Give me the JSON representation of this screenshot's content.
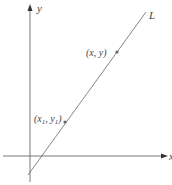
{
  "diagram": {
    "axes": {
      "x_label": "x",
      "y_label": "y",
      "origin_px": [
        30,
        156
      ]
    },
    "line": {
      "label": "L",
      "color": "#555555",
      "start_px": [
        28,
        175
      ],
      "end_px": [
        146,
        12
      ]
    },
    "points": [
      {
        "label": "(x, y)",
        "px": [
          117,
          52
        ]
      },
      {
        "label_main": "(x",
        "sub1": "1",
        "mid": ", y",
        "sub2": "1",
        "close": ")",
        "px": [
          65,
          122
        ]
      }
    ],
    "colors": {
      "axis": "#555555",
      "text": "#444444",
      "point": "#666666"
    }
  }
}
